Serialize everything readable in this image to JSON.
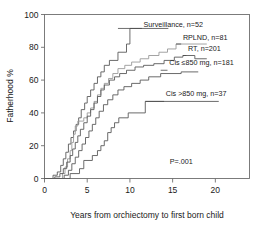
{
  "chart_data": {
    "type": "line",
    "subtype": "kaplan-meier-step",
    "title": "",
    "xlabel": "Years from orchiectomy to first born child",
    "ylabel": "Fatherhood %",
    "xlim": [
      0,
      24
    ],
    "ylim": [
      0,
      100
    ],
    "xticks": [
      0,
      5,
      10,
      15,
      20
    ],
    "xtick_labels": [
      "0",
      "5",
      "10",
      "15",
      "20"
    ],
    "yticks": [
      0,
      20,
      40,
      60,
      80,
      100
    ],
    "ytick_labels": [
      "0",
      "20",
      "40",
      "60",
      "80",
      "100"
    ],
    "grid": false,
    "legend_position": "inline-annotations",
    "annotations": [
      {
        "text": "P=.001",
        "x": 16.0,
        "y": 9.0
      }
    ],
    "series": [
      {
        "name": "Surveillance, n=52",
        "label": "Surveillance, n=52",
        "n": 52,
        "color": "#5a5a5a",
        "label_x": 11.6,
        "label_y": 92.5,
        "leader": {
          "x1": 8.6,
          "y1": 91.5,
          "x2": 11.4,
          "y2": 91.5,
          "drop_to": 91.5
        },
        "points": [
          [
            0.0,
            0
          ],
          [
            1.0,
            0
          ],
          [
            1.0,
            2
          ],
          [
            1.5,
            2
          ],
          [
            1.5,
            4
          ],
          [
            1.9,
            4
          ],
          [
            1.9,
            8
          ],
          [
            2.2,
            8
          ],
          [
            2.2,
            12
          ],
          [
            2.5,
            12
          ],
          [
            2.5,
            16
          ],
          [
            2.8,
            16
          ],
          [
            2.8,
            21
          ],
          [
            3.1,
            21
          ],
          [
            3.1,
            25
          ],
          [
            3.4,
            25
          ],
          [
            3.4,
            29
          ],
          [
            3.7,
            29
          ],
          [
            3.7,
            33
          ],
          [
            4.0,
            33
          ],
          [
            4.0,
            37
          ],
          [
            4.3,
            37
          ],
          [
            4.3,
            42
          ],
          [
            4.7,
            42
          ],
          [
            4.7,
            46
          ],
          [
            5.0,
            46
          ],
          [
            5.0,
            50
          ],
          [
            5.4,
            50
          ],
          [
            5.4,
            54
          ],
          [
            5.8,
            54
          ],
          [
            5.8,
            58
          ],
          [
            6.2,
            58
          ],
          [
            6.2,
            62
          ],
          [
            6.6,
            62
          ],
          [
            6.6,
            65
          ],
          [
            7.0,
            65
          ],
          [
            7.0,
            69
          ],
          [
            7.6,
            69
          ],
          [
            7.6,
            72
          ],
          [
            8.6,
            72
          ],
          [
            8.6,
            77
          ],
          [
            9.6,
            77
          ],
          [
            9.6,
            82
          ],
          [
            10.0,
            82
          ],
          [
            10.0,
            91.5
          ],
          [
            14.5,
            91.5
          ]
        ]
      },
      {
        "name": "RPLND, n=81",
        "label": "RPLND, n=81",
        "n": 81,
        "color": "#9a9a9a",
        "label_x": 16.2,
        "label_y": 84.5,
        "leader": {
          "x1": 15.4,
          "y1": 82.0,
          "x2": 16.0,
          "y2": 82.0
        },
        "points": [
          [
            0.0,
            0
          ],
          [
            2.1,
            0
          ],
          [
            2.1,
            3
          ],
          [
            2.4,
            3
          ],
          [
            2.4,
            7
          ],
          [
            2.7,
            7
          ],
          [
            2.7,
            12
          ],
          [
            3.0,
            12
          ],
          [
            3.0,
            17
          ],
          [
            3.2,
            17
          ],
          [
            3.2,
            22
          ],
          [
            3.4,
            22
          ],
          [
            3.4,
            27
          ],
          [
            3.6,
            27
          ],
          [
            3.6,
            32
          ],
          [
            3.9,
            32
          ],
          [
            3.9,
            35
          ],
          [
            4.6,
            35
          ],
          [
            4.6,
            37
          ],
          [
            5.0,
            37
          ],
          [
            5.0,
            40
          ],
          [
            5.4,
            40
          ],
          [
            5.4,
            43
          ],
          [
            5.8,
            43
          ],
          [
            5.8,
            47
          ],
          [
            6.2,
            47
          ],
          [
            6.2,
            51
          ],
          [
            6.6,
            51
          ],
          [
            6.6,
            55
          ],
          [
            7.0,
            55
          ],
          [
            7.0,
            58
          ],
          [
            7.5,
            58
          ],
          [
            7.5,
            61
          ],
          [
            8.0,
            61
          ],
          [
            8.0,
            64
          ],
          [
            8.6,
            64
          ],
          [
            8.6,
            67
          ],
          [
            9.4,
            67
          ],
          [
            9.4,
            69
          ],
          [
            10.2,
            69
          ],
          [
            10.2,
            71
          ],
          [
            11.2,
            71
          ],
          [
            11.2,
            73
          ],
          [
            12.2,
            73
          ],
          [
            12.2,
            75
          ],
          [
            13.4,
            75
          ],
          [
            13.4,
            77
          ],
          [
            14.4,
            77
          ],
          [
            14.4,
            79
          ],
          [
            15.4,
            79
          ],
          [
            15.4,
            82
          ],
          [
            19.0,
            82
          ]
        ]
      },
      {
        "name": "RT, n=201",
        "label": "RT, n=201",
        "n": 201,
        "color": "#5a5a5a",
        "label_x": 16.8,
        "label_y": 77.5,
        "leader": {
          "x1": 16.2,
          "y1": 75.0,
          "x2": 16.6,
          "y2": 75.0
        },
        "points": [
          [
            0.0,
            0
          ],
          [
            1.2,
            0
          ],
          [
            1.2,
            1
          ],
          [
            1.8,
            1
          ],
          [
            1.8,
            3
          ],
          [
            2.2,
            3
          ],
          [
            2.2,
            6
          ],
          [
            2.6,
            6
          ],
          [
            2.6,
            10
          ],
          [
            3.0,
            10
          ],
          [
            3.0,
            14
          ],
          [
            3.3,
            14
          ],
          [
            3.3,
            18
          ],
          [
            3.6,
            18
          ],
          [
            3.6,
            22
          ],
          [
            3.9,
            22
          ],
          [
            3.9,
            26
          ],
          [
            4.2,
            26
          ],
          [
            4.2,
            30
          ],
          [
            4.6,
            30
          ],
          [
            4.6,
            34
          ],
          [
            5.0,
            34
          ],
          [
            5.0,
            38
          ],
          [
            5.4,
            38
          ],
          [
            5.4,
            42
          ],
          [
            5.8,
            42
          ],
          [
            5.8,
            46
          ],
          [
            6.2,
            46
          ],
          [
            6.2,
            50
          ],
          [
            6.6,
            50
          ],
          [
            6.6,
            54
          ],
          [
            7.0,
            54
          ],
          [
            7.0,
            57
          ],
          [
            7.6,
            57
          ],
          [
            7.6,
            60
          ],
          [
            8.2,
            60
          ],
          [
            8.2,
            62
          ],
          [
            8.8,
            62
          ],
          [
            8.8,
            64
          ],
          [
            9.6,
            64
          ],
          [
            9.6,
            66
          ],
          [
            10.6,
            66
          ],
          [
            10.6,
            68
          ],
          [
            11.6,
            68
          ],
          [
            11.6,
            69
          ],
          [
            12.8,
            69
          ],
          [
            12.8,
            70
          ],
          [
            14.0,
            70
          ],
          [
            14.0,
            72
          ],
          [
            15.2,
            72
          ],
          [
            15.2,
            74
          ],
          [
            16.2,
            74
          ],
          [
            16.2,
            75
          ],
          [
            17.6,
            75
          ],
          [
            17.6,
            73
          ],
          [
            19.0,
            73
          ]
        ]
      },
      {
        "name": "Cis ≤850 mg, n=181",
        "label": "Cis ≤850 mg, n=181",
        "n": 181,
        "color": "#5a5a5a",
        "label_x": 14.6,
        "label_y": 69.0,
        "leader": {
          "x1": 13.6,
          "y1": 66.0,
          "x2": 14.4,
          "y2": 66.0
        },
        "points": [
          [
            0.0,
            0
          ],
          [
            2.3,
            0
          ],
          [
            2.3,
            2
          ],
          [
            2.8,
            2
          ],
          [
            2.8,
            5
          ],
          [
            3.2,
            5
          ],
          [
            3.2,
            9
          ],
          [
            3.6,
            9
          ],
          [
            3.6,
            13
          ],
          [
            4.0,
            13
          ],
          [
            4.0,
            17
          ],
          [
            4.4,
            17
          ],
          [
            4.4,
            21
          ],
          [
            4.8,
            21
          ],
          [
            4.8,
            25
          ],
          [
            5.2,
            25
          ],
          [
            5.2,
            29
          ],
          [
            5.6,
            29
          ],
          [
            5.6,
            33
          ],
          [
            6.0,
            33
          ],
          [
            6.0,
            37
          ],
          [
            6.4,
            37
          ],
          [
            6.4,
            41
          ],
          [
            6.9,
            41
          ],
          [
            6.9,
            45
          ],
          [
            7.4,
            45
          ],
          [
            7.4,
            48
          ],
          [
            8.0,
            48
          ],
          [
            8.0,
            51
          ],
          [
            8.6,
            51
          ],
          [
            8.6,
            54
          ],
          [
            9.3,
            54
          ],
          [
            9.3,
            56
          ],
          [
            10.2,
            56
          ],
          [
            10.2,
            58
          ],
          [
            11.2,
            58
          ],
          [
            11.2,
            60
          ],
          [
            12.2,
            60
          ],
          [
            12.2,
            62
          ],
          [
            13.6,
            62
          ],
          [
            13.6,
            64
          ],
          [
            16.0,
            64
          ],
          [
            16.0,
            65
          ],
          [
            18.0,
            65
          ]
        ]
      },
      {
        "name": "Cis >850 mg, n=37",
        "label": "Cis >850 mg, n=37",
        "n": 37,
        "color": "#5a5a5a",
        "label_x": 14.2,
        "label_y": 50.5,
        "leader": {
          "x1": 11.8,
          "y1": 47.0,
          "x2": 14.0,
          "y2": 47.0
        },
        "points": [
          [
            0.0,
            0
          ],
          [
            3.0,
            0
          ],
          [
            3.0,
            3
          ],
          [
            4.1,
            3
          ],
          [
            4.1,
            6
          ],
          [
            4.6,
            6
          ],
          [
            4.6,
            11
          ],
          [
            5.6,
            11
          ],
          [
            5.6,
            14
          ],
          [
            6.2,
            14
          ],
          [
            6.2,
            17
          ],
          [
            6.6,
            17
          ],
          [
            6.6,
            20
          ],
          [
            7.0,
            20
          ],
          [
            7.0,
            23
          ],
          [
            7.4,
            23
          ],
          [
            7.4,
            28
          ],
          [
            7.8,
            28
          ],
          [
            7.8,
            31
          ],
          [
            8.2,
            31
          ],
          [
            8.2,
            34
          ],
          [
            8.7,
            34
          ],
          [
            8.7,
            37
          ],
          [
            9.8,
            37
          ],
          [
            9.8,
            40
          ],
          [
            11.8,
            40
          ],
          [
            11.8,
            47
          ],
          [
            20.4,
            47
          ]
        ]
      }
    ]
  }
}
